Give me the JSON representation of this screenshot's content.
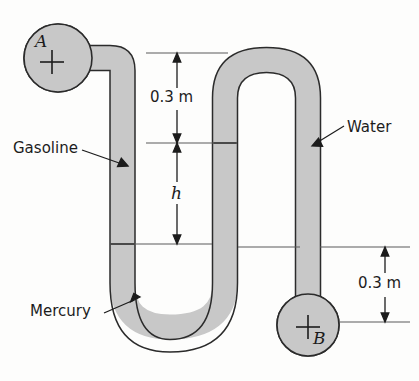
{
  "figure": {
    "colors": {
      "tube_fill": "#c8c8c8",
      "tube_outline": "#2b2b2b",
      "background": "#fdfdfc",
      "annotation": "#1c1c1c"
    },
    "points": [
      {
        "id": "point-a",
        "label": "A",
        "marker": "plus",
        "cx": 58,
        "cy": 58,
        "r": 34
      },
      {
        "id": "point-b",
        "label": "B",
        "marker": "plus",
        "cx": 308,
        "cy": 325,
        "r": 31
      }
    ],
    "fluid_labels": [
      {
        "id": "gasoline",
        "text": "Gasoline"
      },
      {
        "id": "water",
        "text": "Water"
      },
      {
        "id": "mercury",
        "text": "Mercury"
      }
    ],
    "dimensions": [
      {
        "id": "dim-top",
        "text": "0.3 m",
        "orientation": "vertical"
      },
      {
        "id": "dim-h",
        "text": "h",
        "orientation": "vertical",
        "style": "italic"
      },
      {
        "id": "dim-right",
        "text": "0.3 m",
        "orientation": "vertical"
      }
    ]
  }
}
